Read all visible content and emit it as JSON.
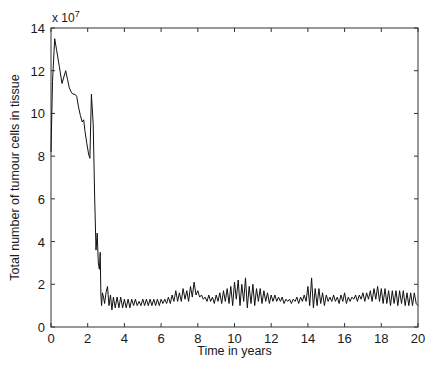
{
  "chart_data": {
    "type": "line",
    "title": "",
    "xlabel": "Time in years",
    "ylabel": "Total number of tumour cells in tissue",
    "y_multiplier_label": "x 10",
    "y_multiplier_exponent": "7",
    "xlim": [
      0,
      20
    ],
    "ylim": [
      0,
      14
    ],
    "x_ticks": [
      0,
      2,
      4,
      6,
      8,
      10,
      12,
      14,
      16,
      18,
      20
    ],
    "y_ticks": [
      0,
      2,
      4,
      6,
      8,
      10,
      12,
      14
    ],
    "grid": false,
    "legend": null,
    "series": [
      {
        "name": "Total tumour cells",
        "color": "#111111",
        "x": [
          0,
          0.08,
          0.2,
          0.3,
          0.45,
          0.6,
          0.7,
          0.8,
          0.9,
          1.0,
          1.1,
          1.2,
          1.3,
          1.4,
          1.5,
          1.6,
          1.7,
          1.78,
          1.85,
          1.95,
          2.05,
          2.12,
          2.2,
          2.3,
          2.38,
          2.45,
          2.52,
          2.58,
          2.64,
          2.68,
          2.72,
          2.76,
          2.8,
          2.86,
          2.92,
          3.0,
          3.08,
          3.16,
          3.24,
          3.32,
          3.4,
          3.5,
          3.6,
          3.7,
          3.8,
          3.9,
          4.0,
          4.1,
          4.2,
          4.3,
          4.4,
          4.5,
          4.6,
          4.7,
          4.8,
          4.9,
          5.0,
          5.1,
          5.2,
          5.3,
          5.4,
          5.5,
          5.6,
          5.7,
          5.8,
          5.9,
          6.0,
          6.1,
          6.2,
          6.3,
          6.4,
          6.5,
          6.6,
          6.7,
          6.8,
          6.9,
          7.0,
          7.1,
          7.2,
          7.3,
          7.4,
          7.5,
          7.6,
          7.7,
          7.8,
          7.9,
          8.0,
          8.1,
          8.2,
          8.3,
          8.4,
          8.5,
          8.6,
          8.7,
          8.8,
          8.9,
          9.0,
          9.1,
          9.2,
          9.3,
          9.4,
          9.5,
          9.6,
          9.7,
          9.8,
          9.9,
          10.0,
          10.1,
          10.2,
          10.3,
          10.4,
          10.5,
          10.6,
          10.7,
          10.8,
          10.9,
          11.0,
          11.1,
          11.2,
          11.3,
          11.4,
          11.5,
          11.6,
          11.7,
          11.8,
          11.9,
          12.0,
          12.1,
          12.2,
          12.3,
          12.4,
          12.5,
          12.6,
          12.7,
          12.8,
          12.9,
          13.0,
          13.1,
          13.2,
          13.3,
          13.4,
          13.5,
          13.6,
          13.7,
          13.8,
          13.9,
          14.0,
          14.1,
          14.2,
          14.3,
          14.4,
          14.5,
          14.6,
          14.7,
          14.8,
          14.9,
          15.0,
          15.1,
          15.2,
          15.3,
          15.4,
          15.5,
          15.6,
          15.7,
          15.8,
          15.9,
          16.0,
          16.1,
          16.2,
          16.3,
          16.4,
          16.5,
          16.6,
          16.7,
          16.8,
          16.9,
          17.0,
          17.1,
          17.2,
          17.3,
          17.4,
          17.5,
          17.6,
          17.7,
          17.8,
          17.9,
          18.0,
          18.1,
          18.2,
          18.3,
          18.4,
          18.5,
          18.6,
          18.7,
          18.8,
          18.9,
          19.0,
          19.1,
          19.2,
          19.3,
          19.4,
          19.5,
          19.6,
          19.7,
          19.8,
          19.9,
          20.0
        ],
        "values": [
          8.2,
          11.5,
          13.5,
          13.0,
          12.2,
          11.4,
          11.7,
          12.0,
          11.6,
          11.2,
          11.0,
          10.9,
          10.9,
          10.8,
          10.3,
          9.9,
          9.6,
          9.7,
          9.2,
          8.6,
          8.1,
          7.9,
          10.9,
          9.5,
          6.0,
          3.6,
          4.4,
          3.0,
          2.7,
          3.5,
          1.5,
          1.0,
          1.6,
          1.4,
          1.1,
          1.6,
          1.9,
          1.0,
          1.5,
          0.8,
          1.4,
          0.9,
          1.4,
          0.9,
          1.4,
          0.9,
          1.3,
          0.9,
          1.3,
          0.9,
          1.3,
          1.0,
          1.3,
          1.0,
          1.2,
          1.0,
          1.3,
          1.0,
          1.3,
          1.0,
          1.3,
          1.0,
          1.3,
          1.0,
          1.3,
          1.0,
          1.3,
          1.1,
          1.3,
          1.1,
          1.4,
          1.1,
          1.5,
          1.2,
          1.7,
          1.2,
          1.6,
          1.2,
          1.8,
          1.3,
          1.7,
          1.2,
          1.9,
          1.4,
          2.1,
          1.5,
          1.7,
          1.4,
          1.5,
          1.3,
          1.4,
          1.2,
          1.5,
          1.2,
          1.4,
          1.1,
          1.5,
          1.2,
          1.6,
          1.1,
          1.7,
          1.2,
          1.8,
          1.1,
          1.9,
          1.0,
          2.1,
          1.3,
          2.2,
          1.0,
          2.0,
          1.2,
          2.3,
          0.9,
          1.9,
          1.1,
          2.0,
          1.0,
          1.8,
          1.2,
          1.8,
          1.1,
          1.7,
          1.2,
          1.6,
          1.1,
          1.5,
          1.2,
          1.5,
          1.2,
          1.4,
          1.2,
          1.4,
          1.1,
          1.3,
          1.2,
          1.3,
          1.1,
          1.3,
          1.2,
          1.4,
          1.1,
          1.4,
          1.2,
          1.5,
          1.2,
          1.9,
          1.0,
          2.3,
          0.9,
          1.8,
          1.0,
          1.8,
          1.1,
          1.6,
          1.0,
          1.5,
          1.2,
          1.4,
          1.2,
          1.5,
          1.2,
          1.4,
          1.1,
          1.5,
          1.2,
          1.6,
          1.1,
          1.4,
          1.2,
          1.4,
          1.3,
          1.5,
          1.2,
          1.5,
          1.3,
          1.6,
          1.2,
          1.6,
          1.3,
          1.7,
          1.2,
          1.8,
          1.3,
          1.9,
          1.2,
          1.8,
          1.1,
          1.8,
          1.1,
          1.7,
          1.0,
          1.7,
          1.1,
          1.7,
          1.0,
          1.7,
          1.1,
          1.7,
          1.0,
          1.6,
          1.0,
          1.6,
          1.0,
          1.6,
          1.1,
          1.0
        ]
      }
    ]
  },
  "plot_area": {
    "left": 51,
    "top": 28,
    "right": 418,
    "bottom": 327
  }
}
